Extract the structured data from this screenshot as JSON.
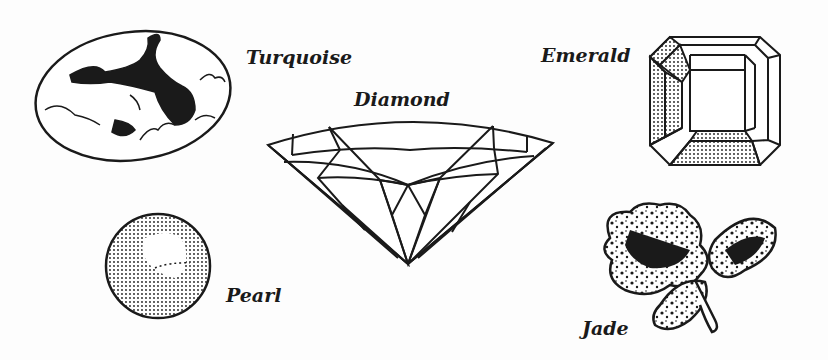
{
  "figure": {
    "gems": [
      {
        "name": "Turquoise",
        "label": "Turquoise"
      },
      {
        "name": "Diamond",
        "label": "Diamond"
      },
      {
        "name": "Emerald",
        "label": "Emerald"
      },
      {
        "name": "Pearl",
        "label": "Pearl"
      },
      {
        "name": "Jade",
        "label": "Jade"
      }
    ],
    "colors": {
      "ink": "#1a1a1a",
      "background": "#fdfdfd"
    }
  }
}
